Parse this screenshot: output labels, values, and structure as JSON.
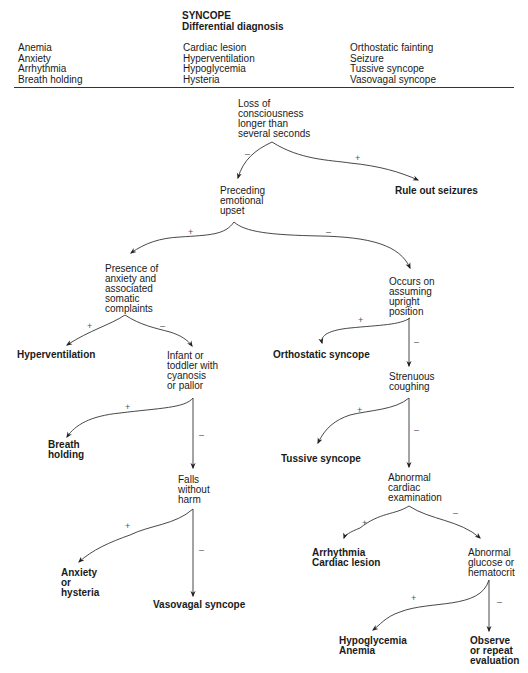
{
  "header": {
    "title": "SYNCOPE",
    "subtitle": "Differential diagnosis"
  },
  "differential": {
    "col1": [
      "Anemia",
      "Anxiety",
      "Arrhythmia",
      "Breath holding"
    ],
    "col2": [
      "Cardiac lesion",
      "Hyperventilation",
      "Hypoglycemia",
      "Hysteria"
    ],
    "col3": [
      "Orthostatic fainting",
      "Seizure",
      "Tussive syncope",
      "Vasovagal syncope"
    ]
  },
  "nodes": {
    "loc": [
      "Loss of",
      "consciousness",
      "longer than",
      "several seconds"
    ],
    "seizures": [
      "Rule out seizures"
    ],
    "emotional": [
      "Preceding",
      "emotional",
      "upset"
    ],
    "anxiety_somatic": [
      "Presence of",
      "anxiety and",
      "associated",
      "somatic",
      "complaints"
    ],
    "upright": [
      "Occurs on",
      "assuming",
      "upright",
      "position"
    ],
    "hyperventilation": [
      "Hyperventilation"
    ],
    "infant": [
      "Infant or",
      "toddler with",
      "cyanosis",
      "or pallor"
    ],
    "orthostatic": [
      "Orthostatic syncope"
    ],
    "coughing": [
      "Strenuous",
      "coughing"
    ],
    "breath": [
      "Breath",
      "holding"
    ],
    "tussive": [
      "Tussive syncope"
    ],
    "falls": [
      "Falls",
      "without",
      "harm"
    ],
    "cardiac_exam": [
      "Abnormal",
      "cardiac",
      "examination"
    ],
    "anx_hyst": [
      "Anxiety",
      "or",
      "hysteria"
    ],
    "vasovagal": [
      "Vasovagal syncope"
    ],
    "arrhythmia": [
      "Arrhythmia",
      "Cardiac lesion"
    ],
    "glucose": [
      "Abnormal",
      "glucose or",
      "hematocrit"
    ],
    "hypoglycemia": [
      "Hypoglycemia",
      "Anemia"
    ],
    "observe": [
      "Observe",
      "or repeat",
      "evaluation"
    ]
  },
  "signs": {
    "plus": "+",
    "minus": "–"
  }
}
